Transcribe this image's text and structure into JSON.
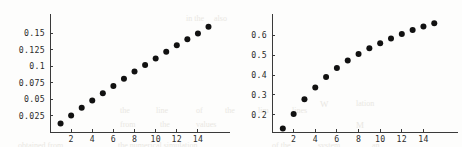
{
  "figure": {
    "background_color": "#fdfdfc",
    "ink_color": "#111111",
    "axis_color": "#3a3a3a",
    "ghost_text_color": "#e9e7e2",
    "ghost_text": [
      {
        "text": "in the",
        "x": 186,
        "y": 14,
        "size": 8
      },
      {
        "text": "also",
        "x": 214,
        "y": 14,
        "size": 8
      },
      {
        "text": "the",
        "x": 120,
        "y": 106,
        "size": 8
      },
      {
        "text": "line",
        "x": 156,
        "y": 106,
        "size": 8
      },
      {
        "text": "of",
        "x": 196,
        "y": 106,
        "size": 8
      },
      {
        "text": "the",
        "x": 225,
        "y": 106,
        "size": 8
      },
      {
        "text": "lim",
        "x": 258,
        "y": 106,
        "size": 8
      },
      {
        "text": "lines",
        "x": 292,
        "y": 106,
        "size": 8
      },
      {
        "text": "from",
        "x": 120,
        "y": 120,
        "size": 8
      },
      {
        "text": "the",
        "x": 160,
        "y": 120,
        "size": 8
      },
      {
        "text": "values",
        "x": 196,
        "y": 120,
        "size": 8
      },
      {
        "text": "obtained from",
        "x": 18,
        "y": 141,
        "size": 8
      },
      {
        "text": "the numerical simulation",
        "x": 118,
        "y": 141,
        "size": 8
      },
      {
        "text": "of the",
        "x": 272,
        "y": 141,
        "size": 8
      },
      {
        "text": "system",
        "x": 318,
        "y": 141,
        "size": 8
      },
      {
        "text": "an",
        "x": 372,
        "y": 141,
        "size": 8
      },
      {
        "text": "W",
        "x": 320,
        "y": 99,
        "size": 9
      },
      {
        "text": "lation",
        "x": 356,
        "y": 99,
        "size": 8
      },
      {
        "text": "M",
        "x": 356,
        "y": 120,
        "size": 9
      }
    ]
  },
  "chart_data": [
    {
      "type": "scatter",
      "panel": "left",
      "title": "",
      "xlabel": "",
      "ylabel": "",
      "xlim": [
        0,
        15.9
      ],
      "ylim": [
        0,
        0.1735
      ],
      "grid": false,
      "legend": null,
      "xticks": [
        2,
        4,
        6,
        8,
        10,
        12,
        14
      ],
      "xtick_labels": [
        "2",
        "4",
        "6",
        "8",
        "10",
        "12",
        "14"
      ],
      "yticks": [
        0.025,
        0.05,
        0.075,
        0.1,
        0.125,
        0.15
      ],
      "ytick_labels": [
        "0.025",
        "0.05",
        "0.075",
        "0.1",
        "0.125",
        "0.15"
      ],
      "x": [
        1,
        2,
        3,
        4,
        5,
        6,
        7,
        8,
        9,
        10,
        11,
        12,
        13,
        14,
        15
      ],
      "values": [
        0.013,
        0.025,
        0.037,
        0.048,
        0.059,
        0.07,
        0.081,
        0.092,
        0.102,
        0.112,
        0.122,
        0.132,
        0.141,
        0.15,
        0.16
      ],
      "marker": "filled-circle",
      "marker_size_px": 4.2
    },
    {
      "type": "scatter",
      "panel": "right",
      "title": "",
      "xlabel": "",
      "ylabel": "",
      "xlim": [
        0,
        15.9
      ],
      "ylim": [
        0.112,
        0.688
      ],
      "grid": false,
      "legend": null,
      "xticks": [
        2,
        4,
        6,
        8,
        10,
        12,
        14
      ],
      "xtick_labels": [
        "2",
        "4",
        "6",
        "8",
        "10",
        "12",
        "14"
      ],
      "yticks": [
        0.2,
        0.3,
        0.4,
        0.5,
        0.6
      ],
      "ytick_labels": [
        "0.2",
        "0.3",
        "0.4",
        "0.5",
        "0.6"
      ],
      "x": [
        1,
        2,
        3,
        4,
        5,
        6,
        7,
        8,
        9,
        10,
        11,
        12,
        13,
        14,
        15
      ],
      "values": [
        0.13,
        0.203,
        0.277,
        0.337,
        0.39,
        0.435,
        0.473,
        0.506,
        0.535,
        0.561,
        0.585,
        0.607,
        0.627,
        0.645,
        0.662
      ],
      "marker": "filled-circle",
      "marker_size_px": 4.2
    }
  ]
}
